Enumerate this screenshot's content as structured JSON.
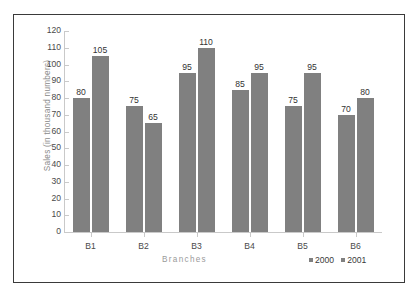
{
  "chart_data": {
    "type": "bar",
    "title": "",
    "xlabel": "Branches",
    "ylabel": "Sales (in thousand numbers)",
    "categories": [
      "B1",
      "B2",
      "B3",
      "B4",
      "B5",
      "B6"
    ],
    "series": [
      {
        "name": "2000",
        "values": [
          80,
          75,
          95,
          85,
          75,
          70
        ],
        "color": "#808080"
      },
      {
        "name": "2001",
        "values": [
          105,
          65,
          110,
          95,
          95,
          80
        ],
        "color": "#808080"
      }
    ],
    "ylim": [
      0,
      120
    ],
    "ytick_step": 10,
    "yticks": [
      120,
      110,
      100,
      90,
      80,
      70,
      60,
      50,
      40,
      30,
      20,
      10,
      0
    ],
    "grid": false,
    "legend_position": "bottom-right",
    "data_labels": true
  },
  "frame": {
    "border_color": "#3a3a3a",
    "background": "#ffffff"
  }
}
